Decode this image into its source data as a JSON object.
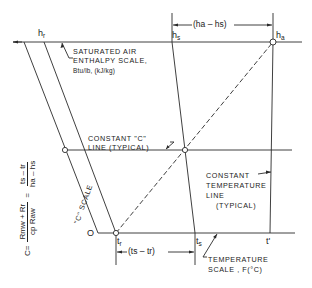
{
  "diagram": {
    "type": "nomograph",
    "colors": {
      "line": "#2a2a2a",
      "background": "#ffffff"
    },
    "top_scale": {
      "title_line1": "SATURATED AIR",
      "title_line2": "ENTHALPY SCALE,",
      "units": "Btu/lb, (kJ/kg)",
      "labels": {
        "hr": "h",
        "hr_sub": "r",
        "hs": "h",
        "hs_sub": "s",
        "ha": "h",
        "ha_sub": "a"
      },
      "difference_label": "(ha – hs)"
    },
    "bottom_scale": {
      "title_line1": "TEMPERATURE",
      "title_line2": "SCALE , F(°C)",
      "labels": {
        "origin": "O",
        "tr": "t",
        "tr_sub": "r",
        "ts": "t",
        "ts_sub": "s",
        "tprime": "t'"
      },
      "difference_label": "(ts – tr)"
    },
    "c_scale": {
      "label": "\"C\" SCALE"
    },
    "constant_c_line": {
      "line1": "CONSTANT \"C\"",
      "line2": "LINE (TYPICAL)"
    },
    "constant_temp_line": {
      "line1": "CONSTANT",
      "line2": "TEMPERATURE",
      "line3": "LINE",
      "line4": "(TYPICAL)"
    },
    "formula": {
      "lhs": "C=",
      "num1": "Rmw + Rr",
      "den1": "cp Raw",
      "eq": "=",
      "num2": "ts – tr",
      "den2": "ha – hs"
    }
  }
}
